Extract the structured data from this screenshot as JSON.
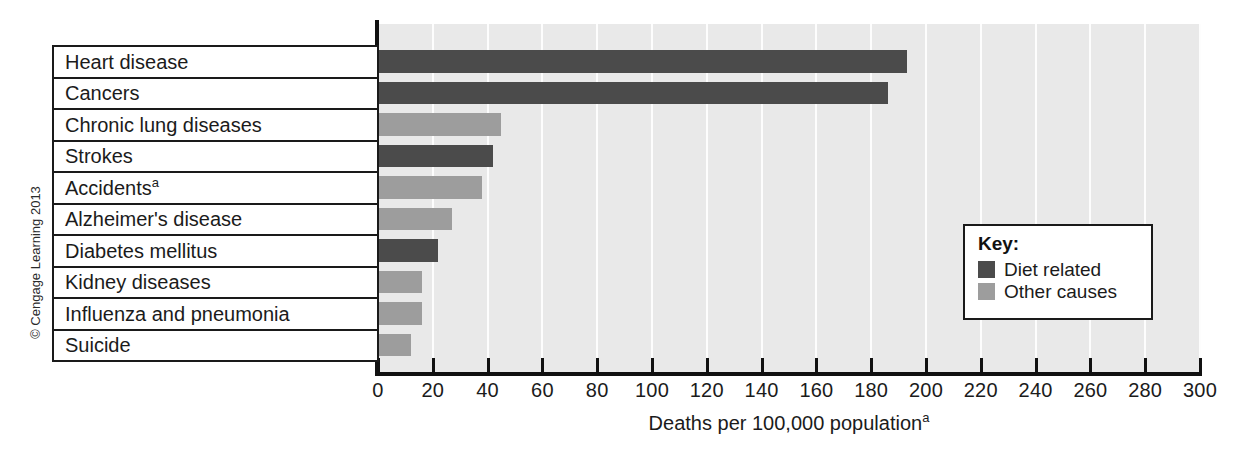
{
  "chart_data": {
    "type": "bar",
    "orientation": "horizontal",
    "title": "",
    "xlabel": "Deaths per 100,000 population",
    "xlabel_superscript": "a",
    "ylabel": "",
    "xlim": [
      0,
      300
    ],
    "xticks": [
      0,
      20,
      40,
      60,
      80,
      100,
      120,
      140,
      160,
      180,
      200,
      220,
      240,
      260,
      280,
      300
    ],
    "xtick_labels": [
      "0",
      "20",
      "40",
      "60",
      "80",
      "100",
      "120",
      "140",
      "160",
      "180",
      "200",
      "220",
      "240",
      "260",
      "280",
      "300"
    ],
    "grid": "vertical-white",
    "legend_position": "inside-right",
    "categories": [
      "Heart disease",
      "Cancers",
      "Chronic lung diseases",
      "Strokes",
      "Accidents",
      "Alzheimer's disease",
      "Diabetes mellitus",
      "Kidney diseases",
      "Influenza and pneumonia",
      "Suicide"
    ],
    "category_superscripts": [
      "",
      "",
      "",
      "",
      "a",
      "",
      "",
      "",
      "",
      ""
    ],
    "values": [
      193,
      186,
      45,
      42,
      38,
      27,
      22,
      16,
      16,
      12
    ],
    "groups": [
      "diet",
      "diet",
      "other",
      "diet",
      "other",
      "other",
      "diet",
      "other",
      "other",
      "other"
    ],
    "series": [
      {
        "name": "Diet related",
        "color": "#4b4b4b"
      },
      {
        "name": "Other causes",
        "color": "#9d9d9d"
      }
    ]
  },
  "legend": {
    "title": "Key:",
    "items": [
      {
        "label": "Diet related",
        "color": "#4b4b4b"
      },
      {
        "label": "Other causes",
        "color": "#9d9d9d"
      }
    ]
  },
  "colors": {
    "plot_background": "#e9e9e9",
    "gridline": "#fdfdfd",
    "axis": "#111111",
    "diet_related": "#4b4b4b",
    "other_causes": "#9d9d9d",
    "page_background": "#ffffff"
  },
  "copyright": "© Cengage Learning 2013"
}
